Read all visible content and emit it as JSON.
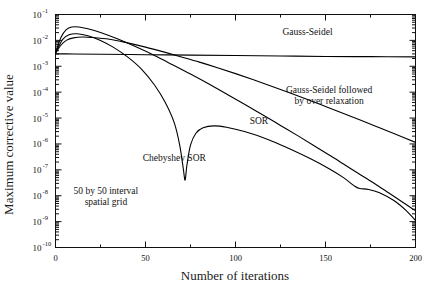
{
  "chart_data": {
    "type": "line",
    "title": "",
    "xlabel": "Number of iterations",
    "ylabel": "Maximum corrective value",
    "xlim": [
      0,
      200
    ],
    "ylim": [
      1e-10,
      0.1
    ],
    "yscale": "log",
    "xscale": "linear",
    "grid": false,
    "legend_position": "inline-annotations",
    "xticks": [
      0,
      50,
      100,
      150,
      200
    ],
    "xticklabels": [
      "0",
      "50",
      "100",
      "150",
      "200"
    ],
    "xminortick_interval": 25,
    "yticks": [
      0.1,
      0.01,
      0.001,
      0.0001,
      1e-05,
      1e-06,
      1e-07,
      1e-08,
      1e-09,
      1e-10
    ],
    "yticklabels": [
      "10-1",
      "10-2",
      "10-3",
      "10-4",
      "10-5",
      "10-6",
      "10-7",
      "10-8",
      "10-9",
      "10-10"
    ],
    "yticklabel_mantissa": "10",
    "yticklabel_exponents": [
      "-1",
      "-2",
      "-3",
      "-4",
      "-5",
      "-6",
      "-7",
      "-8",
      "-9",
      "-10"
    ],
    "annotations": [
      {
        "name": "grid-note",
        "text_line1": "50 by 50 interval",
        "text_line2": "spatial grid",
        "x": 28,
        "y": 1.2e-08
      },
      {
        "name": "gauss-seidel-label",
        "text": "Gauss-Seidel",
        "x": 140,
        "y": 0.016
      },
      {
        "name": "gauss-seidel-overrelax-label",
        "text_line1": "Gauss-Seidel followed",
        "text_line2": "by over relaxation",
        "x": 152,
        "y": 9e-05
      },
      {
        "name": "sor-label",
        "text": "SOR",
        "x": 113,
        "y": 6e-06
      },
      {
        "name": "chebyshev-sor-label",
        "text": "Chebyshev SOR",
        "x": 66,
        "y": 2.2e-07
      }
    ],
    "series": [
      {
        "name": "Gauss-Seidel",
        "color": "#000000",
        "points": [
          [
            0,
            0.003
          ],
          [
            10,
            0.003
          ],
          [
            25,
            0.0029
          ],
          [
            50,
            0.0028
          ],
          [
            75,
            0.0027
          ],
          [
            100,
            0.0026
          ],
          [
            125,
            0.0025
          ],
          [
            150,
            0.0024
          ],
          [
            175,
            0.00235
          ],
          [
            200,
            0.0023
          ]
        ]
      },
      {
        "name": "Gauss-Seidel followed by over relaxation",
        "color": "#000000",
        "points": [
          [
            0,
            0.0032
          ],
          [
            3,
            0.0065
          ],
          [
            6,
            0.01
          ],
          [
            10,
            0.0125
          ],
          [
            15,
            0.0135
          ],
          [
            20,
            0.013
          ],
          [
            30,
            0.011
          ],
          [
            40,
            0.008
          ],
          [
            50,
            0.0055
          ],
          [
            60,
            0.0036
          ],
          [
            70,
            0.0023
          ],
          [
            80,
            0.00145
          ],
          [
            90,
            0.00088
          ],
          [
            100,
            0.00052
          ],
          [
            110,
            0.0003
          ],
          [
            120,
            0.00017
          ],
          [
            130,
            9.5e-05
          ],
          [
            140,
            5.2e-05
          ],
          [
            150,
            2.8e-05
          ],
          [
            160,
            1.5e-05
          ],
          [
            170,
            8e-06
          ],
          [
            180,
            4.2e-06
          ],
          [
            190,
            2.2e-06
          ],
          [
            200,
            1.15e-06
          ]
        ]
      },
      {
        "name": "SOR",
        "color": "#000000",
        "points": [
          [
            0,
            0.0032
          ],
          [
            3,
            0.013
          ],
          [
            6,
            0.026
          ],
          [
            9,
            0.033
          ],
          [
            13,
            0.033
          ],
          [
            18,
            0.028
          ],
          [
            25,
            0.02
          ],
          [
            35,
            0.011
          ],
          [
            45,
            0.0055
          ],
          [
            55,
            0.0026
          ],
          [
            65,
            0.00115
          ],
          [
            75,
            0.0005
          ],
          [
            85,
            0.00021
          ],
          [
            95,
            8.5e-05
          ],
          [
            105,
            3.4e-05
          ],
          [
            115,
            1.35e-05
          ],
          [
            125,
            5.2e-06
          ],
          [
            135,
            2e-06
          ],
          [
            145,
            7.5e-07
          ],
          [
            155,
            2.8e-07
          ],
          [
            165,
            1e-07
          ],
          [
            175,
            3.7e-08
          ],
          [
            185,
            1.3e-08
          ],
          [
            195,
            4.5e-09
          ],
          [
            200,
            2.6e-09
          ]
        ]
      },
      {
        "name": "Chebyshev SOR",
        "color": "#000000",
        "points": [
          [
            0,
            0.0032
          ],
          [
            4,
            0.011
          ],
          [
            8,
            0.017
          ],
          [
            12,
            0.018
          ],
          [
            18,
            0.015
          ],
          [
            25,
            0.01
          ],
          [
            32,
            0.0055
          ],
          [
            40,
            0.0023
          ],
          [
            48,
            0.00075
          ],
          [
            55,
            0.00019
          ],
          [
            61,
            4e-05
          ],
          [
            66,
            6.5e-06
          ],
          [
            69,
            9e-07
          ],
          [
            71,
            1.1e-07
          ],
          [
            72,
            4e-08
          ],
          [
            73,
            1.5e-07
          ],
          [
            75,
            9e-07
          ],
          [
            78,
            2.6e-06
          ],
          [
            82,
            4.2e-06
          ],
          [
            88,
            5e-06
          ],
          [
            95,
            4.4e-06
          ],
          [
            105,
            3e-06
          ],
          [
            118,
            1.5e-06
          ],
          [
            130,
            6.5e-07
          ],
          [
            142,
            2.6e-07
          ],
          [
            152,
            1.1e-07
          ],
          [
            160,
            5e-08
          ],
          [
            166,
            2.4e-08
          ],
          [
            169,
            1.9e-08
          ],
          [
            174,
            1.75e-08
          ],
          [
            180,
            1.3e-08
          ],
          [
            188,
            6.5e-09
          ],
          [
            195,
            2.6e-09
          ],
          [
            200,
            1.1e-09
          ]
        ]
      }
    ]
  }
}
